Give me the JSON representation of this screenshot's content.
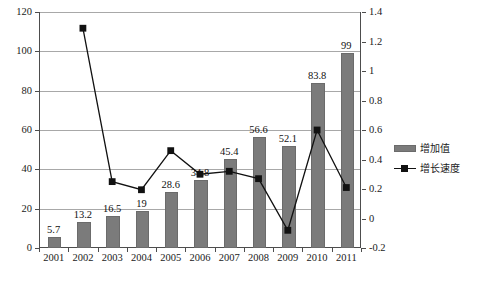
{
  "chart_data": {
    "type": "bar",
    "title": "",
    "subtitle": "",
    "xlabel": "",
    "ylabel": "",
    "y2label": "",
    "categories": [
      "2001",
      "2002",
      "2003",
      "2004",
      "2005",
      "2006",
      "2007",
      "2008",
      "2009",
      "2010",
      "2011"
    ],
    "grid": true,
    "legend_position": "right",
    "ylim": [
      0,
      120
    ],
    "yticks": [
      "0",
      "20",
      "40",
      "60",
      "80",
      "100",
      "120"
    ],
    "ytick_values": [
      0,
      20,
      40,
      60,
      80,
      100,
      120
    ],
    "y2lim": [
      -0.2,
      1.4
    ],
    "y2ticks": [
      "-0.2",
      "0",
      "0.2",
      "0.4",
      "0.6",
      "0.8",
      "1",
      "1.2",
      "1.4"
    ],
    "y2tick_values": [
      -0.2,
      0,
      0.2,
      0.4,
      0.6,
      0.8,
      1,
      1.2,
      1.4
    ],
    "series": [
      {
        "name": "增加值",
        "type": "bar",
        "axis": "left",
        "color": "#7b7b7b",
        "values": [
          5.7,
          13.2,
          16.5,
          19,
          28.6,
          34.8,
          45.4,
          56.6,
          52.1,
          83.8,
          99
        ],
        "labels": [
          "5.7",
          "13.2",
          "16.5",
          "19",
          "28.6",
          "34.8",
          "45.4",
          "56.6",
          "52.1",
          "83.8",
          "99"
        ]
      },
      {
        "name": "增长速度",
        "type": "line",
        "axis": "right",
        "color": "#111111",
        "marker": "square",
        "values": [
          null,
          1.29,
          0.25,
          0.195,
          0.46,
          0.3,
          0.32,
          0.27,
          -0.08,
          0.6,
          0.21
        ]
      }
    ]
  },
  "legend": {
    "items": [
      {
        "label": "增加值",
        "marker": "bar-swatch"
      },
      {
        "label": "增长速度",
        "marker": "line-square-swatch"
      }
    ]
  },
  "caption": {
    "text": ""
  }
}
